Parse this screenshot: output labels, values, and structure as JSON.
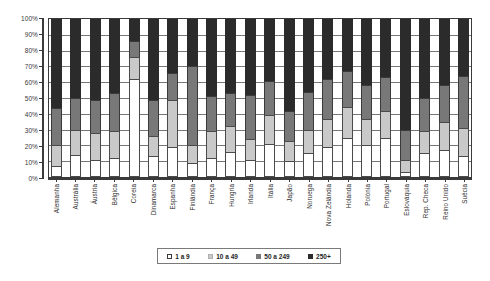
{
  "chart_data": {
    "type": "bar",
    "subtype": "stacked-100-percent",
    "title": "",
    "xlabel": "",
    "ylabel": "",
    "ylim": [
      0,
      100
    ],
    "ytick_labels": [
      "0%",
      "10%",
      "20%",
      "30%",
      "40%",
      "50%",
      "60%",
      "70%",
      "80%",
      "90%",
      "100%"
    ],
    "ytick_values": [
      0,
      10,
      20,
      30,
      40,
      50,
      60,
      70,
      80,
      90,
      100
    ],
    "grid": true,
    "legend_position": "bottom",
    "colors": {
      "1 a 9": "#ffffff",
      "10 a 49": "#c9c9c9",
      "50 a 249": "#787878",
      "250+": "#2b2b2b"
    },
    "categories": [
      "Alemanha",
      "Austrália",
      "Áustria",
      "Bélgica",
      "Coreia",
      "Dinamarca",
      "Espanha",
      "Finlândia",
      "França",
      "Hungria",
      "Irlanda",
      "Itália",
      "Japão",
      "Noruega",
      "Nova Zelândia",
      "Holanda",
      "Polónia",
      "Portugal",
      "Eslováquia",
      "Rep. Checa",
      "Reino Unido",
      "Suécia"
    ],
    "series": [
      {
        "name": "1 a 9",
        "values": [
          7,
          14,
          11,
          12,
          62,
          13,
          19,
          9,
          12,
          16,
          11,
          21,
          10,
          15,
          19,
          25,
          20,
          25,
          3,
          15,
          17,
          13
        ]
      },
      {
        "name": "10 a 49",
        "values": [
          13,
          16,
          17,
          17,
          14,
          13,
          30,
          11,
          17,
          16,
          13,
          18,
          13,
          15,
          18,
          19,
          17,
          17,
          8,
          14,
          18,
          18
        ]
      },
      {
        "name": "50 a 249",
        "values": [
          24,
          20,
          21,
          24,
          10,
          23,
          17,
          50,
          22,
          21,
          28,
          22,
          19,
          24,
          25,
          23,
          21,
          21,
          19,
          21,
          23,
          33
        ]
      },
      {
        "name": "250+",
        "values": [
          56,
          50,
          51,
          47,
          14,
          51,
          34,
          30,
          49,
          47,
          48,
          39,
          58,
          46,
          38,
          33,
          42,
          37,
          70,
          50,
          42,
          36
        ]
      }
    ]
  },
  "legend": {
    "items": [
      {
        "label": "1 a 9",
        "key": "s1"
      },
      {
        "label": "10 a 49",
        "key": "s2"
      },
      {
        "label": "50 a 249",
        "key": "s3"
      },
      {
        "label": "250+",
        "key": "s4"
      }
    ]
  }
}
